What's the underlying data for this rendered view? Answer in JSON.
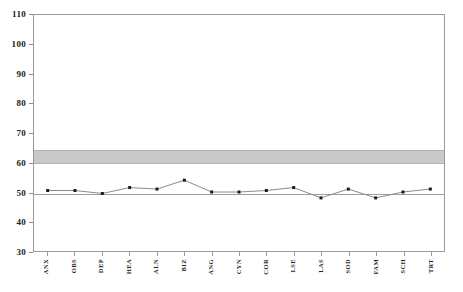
{
  "chart_data": {
    "type": "line",
    "title": "",
    "subtitle": "",
    "xlabel": "",
    "ylabel": "",
    "ylim": [
      30,
      110
    ],
    "yticks": [
      30,
      40,
      50,
      60,
      70,
      80,
      90,
      100,
      110
    ],
    "grid": false,
    "legend": null,
    "categories": [
      "ANX",
      "OBS",
      "DEP",
      "HEA",
      "ALN",
      "BIZ",
      "ANG",
      "CYN",
      "COR",
      "LSE",
      "LAS",
      "SOD",
      "FAM",
      "SCH",
      "TRT"
    ],
    "series": [
      {
        "name": "Profile",
        "values": [
          50.5,
          50.5,
          49.5,
          51.5,
          51.0,
          54.0,
          50.0,
          50.0,
          50.5,
          51.5,
          48.0,
          51.0,
          48.0,
          50.0,
          51.0
        ]
      }
    ],
    "annotations": {
      "reference_line": {
        "value": 50,
        "style": "solid",
        "color": "#9e9e9e"
      },
      "shaded_band": {
        "from": 60,
        "to": 64.5,
        "color": "#c9c9c9",
        "label": "normative band"
      }
    },
    "marker": {
      "shape": "square",
      "color": "#1a1a1a",
      "size": 3
    },
    "line": {
      "color": "#8a8a8a",
      "width": 1
    }
  }
}
